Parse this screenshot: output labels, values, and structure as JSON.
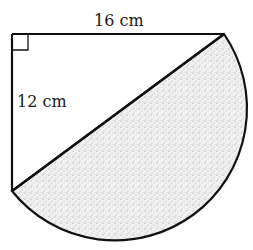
{
  "figure": {
    "labels": {
      "top_side": "16 cm",
      "left_side": "12 cm"
    },
    "shapes": {
      "triangle": "right triangle with legs 16 cm and 12 cm",
      "right_angle_marker": "top-left corner",
      "semicircle": "shaded semicircle on hypotenuse"
    },
    "colors": {
      "stroke": "#111111",
      "shade": "#e6e6e6",
      "background": "#ffffff"
    }
  }
}
